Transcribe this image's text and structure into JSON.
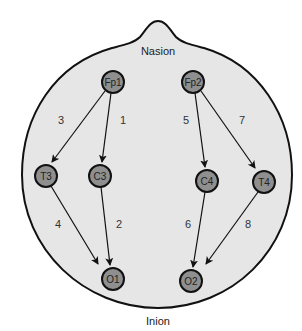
{
  "diagram": {
    "type": "EEG electrode montage (bipolar chain)",
    "landmarks": {
      "top": "Nasion",
      "bottom": "Inion"
    },
    "colors": {
      "head_fill": "#e6e6e6",
      "head_stroke": "#111111",
      "node_fill": "#8f8f8f",
      "node_stroke": "#111111",
      "arrow": "#111111"
    },
    "nodes": [
      {
        "id": "Fp1",
        "label": "Fp1",
        "x": 113,
        "y": 82
      },
      {
        "id": "Fp2",
        "label": "Fp2",
        "x": 193,
        "y": 82
      },
      {
        "id": "T3",
        "label": "T3",
        "x": 46,
        "y": 176
      },
      {
        "id": "C3",
        "label": "C3",
        "x": 100,
        "y": 176
      },
      {
        "id": "C4",
        "label": "C4",
        "x": 207,
        "y": 181
      },
      {
        "id": "T4",
        "label": "T4",
        "x": 264,
        "y": 182
      },
      {
        "id": "O1",
        "label": "O1",
        "x": 113,
        "y": 279
      },
      {
        "id": "O2",
        "label": "O2",
        "x": 191,
        "y": 281
      }
    ],
    "edges": [
      {
        "number": "1",
        "from": "Fp1",
        "to": "C3"
      },
      {
        "number": "2",
        "from": "C3",
        "to": "O1"
      },
      {
        "number": "3",
        "from": "Fp1",
        "to": "T3"
      },
      {
        "number": "4",
        "from": "T3",
        "to": "O1"
      },
      {
        "number": "5",
        "from": "Fp2",
        "to": "C4"
      },
      {
        "number": "6",
        "from": "C4",
        "to": "O2"
      },
      {
        "number": "7",
        "from": "Fp2",
        "to": "T4"
      },
      {
        "number": "8",
        "from": "T4",
        "to": "O2"
      }
    ],
    "edge_labels": [
      {
        "text": "3",
        "x": 61,
        "y": 120
      },
      {
        "text": "1",
        "x": 123,
        "y": 120
      },
      {
        "text": "5",
        "x": 186,
        "y": 120
      },
      {
        "text": "7",
        "x": 242,
        "y": 120
      },
      {
        "text": "4",
        "x": 58,
        "y": 224
      },
      {
        "text": "2",
        "x": 119,
        "y": 224
      },
      {
        "text": "6",
        "x": 188,
        "y": 224
      },
      {
        "text": "8",
        "x": 248,
        "y": 224
      }
    ]
  }
}
